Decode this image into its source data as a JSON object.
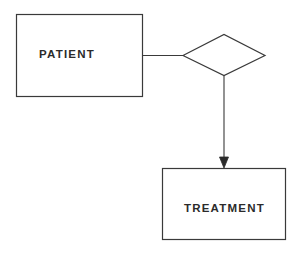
{
  "diagram": {
    "type": "entity-relationship",
    "stroke_color": "#3a3a3a",
    "text_color": "#2b2b2b",
    "background": "#ffffff",
    "entities": [
      {
        "id": "patient",
        "label": "PATIENT",
        "x": 16,
        "y": 14,
        "width": 126,
        "height": 82
      },
      {
        "id": "treatment",
        "label": "TREATMENT",
        "x": 162,
        "y": 168,
        "width": 123,
        "height": 71
      }
    ],
    "relationships": [
      {
        "id": "rel-1",
        "shape": "diamond",
        "label": "",
        "cx": 224,
        "cy": 55,
        "half_width": 41,
        "half_height": 21
      }
    ],
    "connectors": [
      {
        "from": "patient",
        "to": "rel-1",
        "arrow": false
      },
      {
        "from": "rel-1",
        "to": "treatment",
        "arrow": true
      }
    ]
  }
}
